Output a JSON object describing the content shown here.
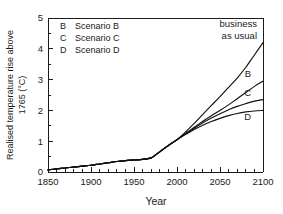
{
  "chart_data": {
    "type": "line",
    "title": "",
    "xlabel": "Year",
    "ylabel": "Realised temperature rise above 1765 (°C)",
    "ylabel_line1": "Realised temperature rise above",
    "ylabel_line2": "1765 (°C)",
    "xlim": [
      1850,
      2100
    ],
    "ylim": [
      0,
      5
    ],
    "xticks": [
      1850,
      1900,
      1950,
      2000,
      2050,
      2100
    ],
    "xtick_labels": [
      "1850",
      "1900",
      "1950",
      "2000",
      "2050",
      "2100"
    ],
    "x_minor_step": 10,
    "yticks": [
      0,
      1,
      2,
      3,
      4,
      5
    ],
    "ytick_labels": [
      "0",
      "1",
      "2",
      "3",
      "4",
      "5"
    ],
    "y_minor_step": 0.5,
    "grid": false,
    "legend_position": "upper-left",
    "line_color": "#111111",
    "series": [
      {
        "name": "business as usual",
        "label": "business as usual",
        "end_value": 4.2,
        "x": [
          1850,
          1860,
          1870,
          1880,
          1890,
          1900,
          1910,
          1920,
          1930,
          1940,
          1950,
          1960,
          1970,
          1975,
          1980,
          1990,
          2000,
          2010,
          2020,
          2030,
          2040,
          2050,
          2060,
          2070,
          2080,
          2090,
          2100
        ],
        "values": [
          0.07,
          0.1,
          0.13,
          0.16,
          0.19,
          0.22,
          0.26,
          0.3,
          0.34,
          0.37,
          0.39,
          0.41,
          0.46,
          0.55,
          0.66,
          0.86,
          1.05,
          1.3,
          1.58,
          1.87,
          2.16,
          2.45,
          2.75,
          3.05,
          3.4,
          3.8,
          4.2
        ]
      },
      {
        "name": "Scenario B",
        "label": "B",
        "end_value": 2.95,
        "x": [
          1850,
          1860,
          1870,
          1880,
          1890,
          1900,
          1910,
          1920,
          1930,
          1940,
          1950,
          1960,
          1970,
          1975,
          1980,
          1990,
          2000,
          2010,
          2020,
          2030,
          2040,
          2050,
          2060,
          2070,
          2080,
          2090,
          2100
        ],
        "values": [
          0.07,
          0.1,
          0.13,
          0.16,
          0.19,
          0.22,
          0.26,
          0.3,
          0.34,
          0.37,
          0.39,
          0.41,
          0.46,
          0.55,
          0.66,
          0.86,
          1.05,
          1.25,
          1.45,
          1.65,
          1.83,
          2.0,
          2.18,
          2.38,
          2.58,
          2.78,
          2.95
        ]
      },
      {
        "name": "Scenario C",
        "label": "C",
        "end_value": 2.35,
        "x": [
          1850,
          1860,
          1870,
          1880,
          1890,
          1900,
          1910,
          1920,
          1930,
          1940,
          1950,
          1960,
          1970,
          1975,
          1980,
          1990,
          2000,
          2010,
          2020,
          2030,
          2040,
          2050,
          2060,
          2070,
          2080,
          2090,
          2100
        ],
        "values": [
          0.07,
          0.1,
          0.13,
          0.16,
          0.19,
          0.22,
          0.26,
          0.3,
          0.34,
          0.37,
          0.39,
          0.41,
          0.46,
          0.55,
          0.66,
          0.86,
          1.05,
          1.24,
          1.42,
          1.6,
          1.75,
          1.89,
          2.02,
          2.13,
          2.22,
          2.3,
          2.35
        ]
      },
      {
        "name": "Scenario D",
        "label": "D",
        "end_value": 2.0,
        "x": [
          1850,
          1860,
          1870,
          1880,
          1890,
          1900,
          1910,
          1920,
          1930,
          1940,
          1950,
          1960,
          1970,
          1975,
          1980,
          1990,
          2000,
          2010,
          2020,
          2030,
          2040,
          2050,
          2060,
          2070,
          2080,
          2090,
          2100
        ],
        "values": [
          0.07,
          0.1,
          0.13,
          0.16,
          0.19,
          0.22,
          0.26,
          0.3,
          0.34,
          0.37,
          0.39,
          0.41,
          0.46,
          0.55,
          0.66,
          0.86,
          1.05,
          1.22,
          1.38,
          1.52,
          1.64,
          1.74,
          1.83,
          1.9,
          1.95,
          1.98,
          2.0
        ]
      }
    ],
    "annotations": [
      {
        "name": "business-as-usual",
        "line1": "business",
        "line2": "as usual"
      }
    ]
  },
  "legend": {
    "entries": [
      {
        "key": "B",
        "label": "Scenario B"
      },
      {
        "key": "C",
        "label": "Scenario C"
      },
      {
        "key": "D",
        "label": "Scenario D"
      }
    ]
  },
  "curve_labels": {
    "b": "B",
    "c": "C",
    "d": "D"
  },
  "axes": {
    "x_title": "Year",
    "y_title_line1": "Realised temperature rise above",
    "y_title_line2": "1765 (°C)"
  }
}
